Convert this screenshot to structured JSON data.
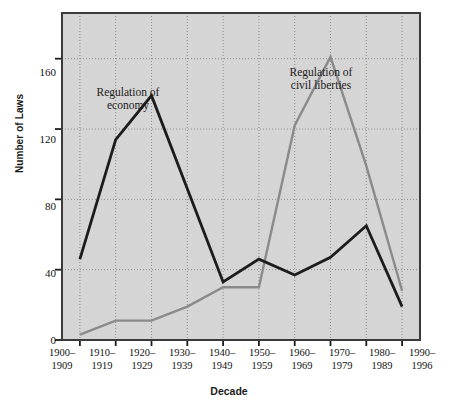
{
  "chart_data": {
    "type": "line",
    "title": "",
    "xlabel": "Decade",
    "ylabel": "Number of Laws",
    "categories": [
      "1900–1909",
      "1910–1919",
      "1920–1929",
      "1930–1939",
      "1940–1949",
      "1950–1959",
      "1960–1969",
      "1970–1979",
      "1980–1989",
      "1990–1996"
    ],
    "category_lines": [
      [
        "1900–",
        "1909"
      ],
      [
        "1910–",
        "1919"
      ],
      [
        "1920–",
        "1929"
      ],
      [
        "1930–",
        "1939"
      ],
      [
        "1940–",
        "1949"
      ],
      [
        "1950–",
        "1959"
      ],
      [
        "1960–",
        "1969"
      ],
      [
        "1970–",
        "1979"
      ],
      [
        "1980–",
        "1989"
      ],
      [
        "1990–",
        "1996"
      ]
    ],
    "series": [
      {
        "name": "Regulation of economy",
        "color": "#1c1c1c",
        "values": [
          46,
          114,
          139,
          86,
          33,
          46,
          37,
          47,
          65,
          19
        ]
      },
      {
        "name": "Regulation of civil liberties",
        "color": "#8a8a8a",
        "values": [
          3,
          11,
          11,
          19,
          30,
          30,
          122,
          161,
          99,
          28
        ]
      }
    ],
    "ylim": [
      0,
      186
    ],
    "yticks": [
      0,
      40,
      80,
      120,
      160
    ],
    "ytick_labels": [
      "0",
      "40",
      "80",
      "120",
      "160"
    ],
    "grid": "dotted-both-axes",
    "legend": "inline-annotations",
    "annotations": [
      {
        "name": "regulation-of-economy",
        "lines": [
          "Regulation of",
          "economy"
        ],
        "x": 128,
        "y": 86
      },
      {
        "name": "regulation-of-civil-liberties",
        "lines": [
          "Regulation of",
          "civil liberties"
        ],
        "x": 321,
        "y": 66
      }
    ],
    "plot_bgcolor": "#d5d5d5",
    "frame_color": "#3a3a3a",
    "gridline_color": "#8d8d8d",
    "page_bgcolor": "#ffffff"
  }
}
